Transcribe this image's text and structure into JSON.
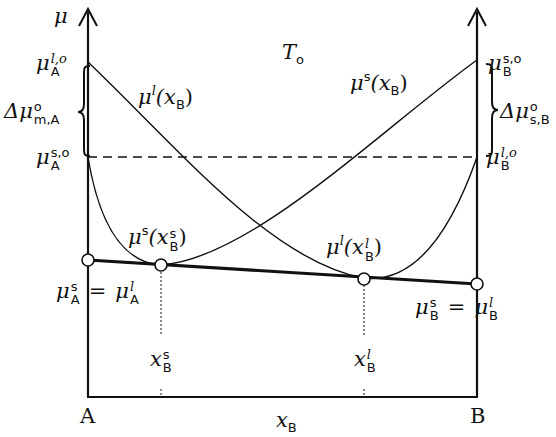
{
  "diagram": {
    "colors": {
      "line": "#111111",
      "background": "#ffffff"
    },
    "axes": {
      "y_axis_label": "μ",
      "x_axis_label": "x_B",
      "left_end_label": "A",
      "right_end_label": "B"
    },
    "labels": {
      "title_main": "T",
      "title_sub": "o",
      "mu": "μ",
      "mu_A_l_o": {
        "base": "μ",
        "sup": "l,o",
        "sub": "A"
      },
      "mu_A_s_o": {
        "base": "μ",
        "sup": "s,o",
        "sub": "A"
      },
      "mu_B_s_o": {
        "base": "μ",
        "sup": "s,o",
        "sub": "B"
      },
      "mu_B_l_o": {
        "base": "μ",
        "sup": "l,o",
        "sub": "B"
      },
      "delta_mu_m_A": {
        "base": "Δμ",
        "sup": "o",
        "sub": "m,A"
      },
      "delta_mu_s_B": {
        "base": "Δμ",
        "sup": "o",
        "sub": "s,B"
      },
      "liquid_curve": {
        "base": "μ",
        "sup": "l",
        "arg": "(x",
        "arg_sub": "B",
        "close": ")"
      },
      "solid_curve": {
        "base": "μ",
        "sup": "s",
        "arg": "(x",
        "arg_sub": "B",
        "close": ")"
      },
      "solid_tangent_point": {
        "base": "μ",
        "sup": "s",
        "arg": "(x",
        "arg_sup": "s",
        "arg_sub": "B",
        "close": ")"
      },
      "liquid_tangent_point": {
        "base": "μ",
        "sup": "l",
        "arg": "(x",
        "arg_sup": "l",
        "arg_sub": "B",
        "close": ")"
      },
      "mu_A_equal": {
        "left": "μ",
        "left_sup": "s",
        "left_sub": "A",
        "eq": "=",
        "right": "μ",
        "right_sup": "l",
        "right_sub": "A"
      },
      "mu_B_equal": {
        "left": "μ",
        "left_sup": "s",
        "left_sub": "B",
        "eq": "=",
        "right": "μ",
        "right_sup": "l",
        "right_sub": "B"
      },
      "x_B_s": {
        "base": "x",
        "sup": "s",
        "sub": "B"
      },
      "x_B_l": {
        "base": "x",
        "sup": "l",
        "sub": "B"
      },
      "x_B": {
        "base": "x",
        "sub": "B"
      },
      "A": "A",
      "B": "B"
    }
  }
}
